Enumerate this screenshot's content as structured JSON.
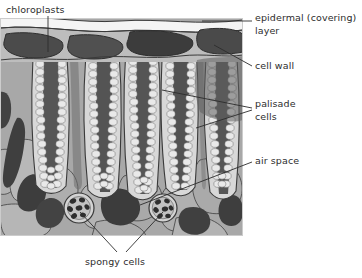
{
  "figure": {
    "palette": {
      "background": "#ffffff",
      "cuticle": "#f2f2f2",
      "epidermis_band": "#b9b9b9",
      "epidermal_cell": "#4a4a4a",
      "cell_wall": "#d6d6d6",
      "vacuole_dark": "#4d4d4d",
      "chloroplast": "#e3e3e3",
      "spongy_tissue": "#a3a3a3",
      "air_space": "#3f3f3f",
      "outline": "#3a3a3a",
      "leader_line": "#2d2d2d",
      "text": "#2d2d2d"
    },
    "frame": {
      "x": 0,
      "y": 18,
      "width": 243,
      "height": 218
    }
  },
  "labels": {
    "chloroplasts": "chloroplasts",
    "epidermal_line1": "epidermal (covering)",
    "epidermal_line2": "layer",
    "cell_wall": "cell wall",
    "palisade_line1": "palisade",
    "palisade_line2": "cells",
    "air_space": "air space",
    "spongy_cells": "spongy cells"
  },
  "structures": {
    "epidermal_cells": 4,
    "palisade_columns": 5,
    "spongy_round_cells": 2,
    "air_spaces": 6
  }
}
